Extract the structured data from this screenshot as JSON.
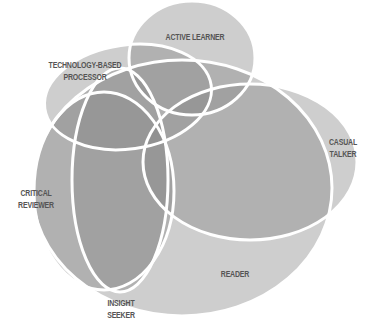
{
  "diagram": {
    "type": "venn",
    "fill_color": "#8a8a8a",
    "stroke_color": "#ffffff",
    "label_color": "#555555",
    "sets": [
      {
        "id": "reader",
        "label": "READER",
        "cx": 182,
        "cy": 188,
        "rx": 150,
        "ry": 128,
        "rot": 0
      },
      {
        "id": "critical-reviewer",
        "label": "CRITICAL\nREVIEWER",
        "cx": 104,
        "cy": 191,
        "rx": 70,
        "ry": 99,
        "rot": 0
      },
      {
        "id": "insight-seeker",
        "label": "INSIGHT\nSEEKER",
        "cx": 120,
        "cy": 180,
        "rx": 48,
        "ry": 112,
        "rot": 0
      },
      {
        "id": "casual-talker",
        "label": "CASUAL\nTALKER",
        "cx": 250,
        "cy": 162,
        "rx": 107,
        "ry": 78,
        "rot": 0
      },
      {
        "id": "active-learner",
        "label": "ACTIVE LEARNER",
        "cx": 192,
        "cy": 58,
        "rx": 63,
        "ry": 57,
        "rot": 0
      },
      {
        "id": "technology-based-processor",
        "label": "TECHNOLOGY-BASED\nPROCESSOR",
        "cx": 128,
        "cy": 97,
        "rx": 84,
        "ry": 52,
        "rot": -8
      }
    ],
    "labels": {
      "active_learner": "ACTIVE LEARNER",
      "technology_based_processor": "TECHNOLOGY-BASED\nPROCESSOR",
      "casual_talker": "CASUAL\nTALKER",
      "critical_reviewer": "CRITICAL\nREVIEWER",
      "reader": "READER",
      "insight_seeker": "INSIGHT\nSEEKER"
    }
  }
}
